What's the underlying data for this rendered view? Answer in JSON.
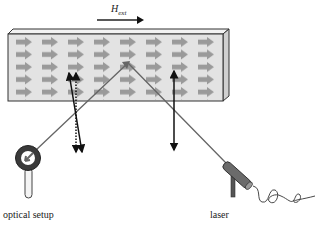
{
  "diagram": {
    "field_label": "H",
    "field_label_sub": "ext",
    "labels": {
      "optical_setup": "optical setup",
      "laser": "laser"
    },
    "sample": {
      "magnetization_arrows": {
        "rows": 5,
        "columns": 8,
        "direction": "right"
      },
      "face_color": "#e3e3e3",
      "arrow_color": "#9a9a9a"
    },
    "beam_color": "#666666"
  }
}
